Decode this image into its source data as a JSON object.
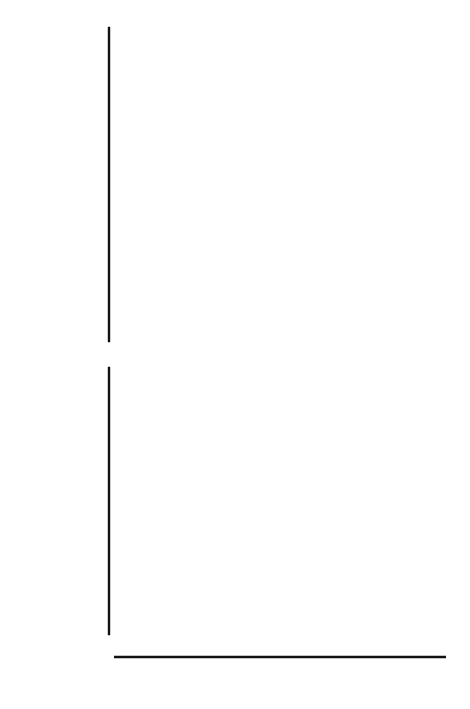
{
  "figure": {
    "annotation": "(Data for England and Wales)",
    "x_axis_title": "Year",
    "top_y_title_lines": [
      "Total",
      "fatal",
      "poisonings"
    ],
    "bottom_y_title_lines": [
      "Percentage",
      "of fatal",
      "poisonings",
      "involving",
      "tricyclic",
      "antidepressant"
    ],
    "ink_color": "#111111",
    "background_color": "#ffffff"
  },
  "chart_data": [
    {
      "type": "line",
      "id": "total-fatal-poisonings",
      "title": "",
      "subtitle": "(Data for England and Wales)",
      "xlabel": "Year",
      "ylabel": "Total fatal poisonings",
      "xlim": [
        1960.4,
        1977.6
      ],
      "ylim": [
        1500,
        3200
      ],
      "xticks": [
        1962,
        1964,
        1966,
        1968,
        1970,
        1972,
        1974,
        1976
      ],
      "xticklabels": [
        "1962",
        "",
        "1966",
        "",
        "1970",
        "",
        "1974",
        ""
      ],
      "yticks": [
        1500,
        1600,
        1700,
        1800,
        1900,
        2000,
        2100,
        2200,
        2300,
        2400,
        2500,
        2600,
        2700,
        2800,
        2900,
        3000,
        3100
      ],
      "ymajorticks": [
        1500,
        2000,
        2500,
        3000
      ],
      "yticklabels": [
        "1500",
        "2000",
        "2500",
        "3000"
      ],
      "grid": false,
      "legend": "none",
      "markers": "filled-circle",
      "x": [
        1961,
        1962,
        1963,
        1964,
        1965,
        1966,
        1967,
        1968,
        1969,
        1970,
        1971,
        1972,
        1973,
        1974,
        1975,
        1976,
        1977
      ],
      "values": [
        1610,
        2025,
        2525,
        2690,
        2640,
        2685,
        2735,
        2840,
        3035,
        2950,
        3040,
        2940,
        2930,
        3145,
        2995,
        2920,
        2975
      ]
    },
    {
      "type": "line",
      "id": "percentage-tricyclic",
      "title": "",
      "xlabel": "Year",
      "ylabel": "Percentage of fatal poisonings involving tricyclic antidepressant",
      "xlim": [
        1960.4,
        1977.6
      ],
      "ylim": [
        0,
        14.5
      ],
      "xticks": [
        1962,
        1964,
        1966,
        1968,
        1970,
        1972,
        1974,
        1976
      ],
      "xticklabels": [
        "1962",
        "",
        "1966",
        "",
        "1970",
        "",
        "1974",
        ""
      ],
      "ymajorticks": [
        0,
        4,
        8,
        12
      ],
      "yticklabels": [
        "0",
        "4",
        "8",
        "12"
      ],
      "grid": false,
      "legend": "none",
      "markers": "filled-circle",
      "x": [
        1961,
        1962,
        1963,
        1964,
        1965,
        1966,
        1967,
        1968,
        1969,
        1970,
        1971,
        1972,
        1973,
        1974,
        1975,
        1976,
        1977
      ],
      "values": [
        0.5,
        0.85,
        1.55,
        1.8,
        2.0,
        2.15,
        3.3,
        3.75,
        4.45,
        5.35,
        6.3,
        6.5,
        9.4,
        10.4,
        12.0,
        13.1,
        14.3
      ]
    }
  ]
}
